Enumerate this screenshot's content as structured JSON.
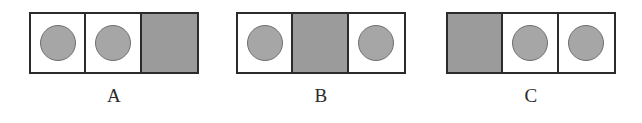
{
  "figure": {
    "colors": {
      "shaded_cell": "#9b9b9b",
      "disc": "#a6a6a6",
      "border": "#2b2b2b",
      "background": "#ffffff",
      "label_text": "#2a2a2a"
    },
    "groups": [
      {
        "label": "A",
        "left": 29,
        "width": 170,
        "cells": [
          {
            "fill": "white",
            "content": "circle"
          },
          {
            "fill": "white",
            "content": "circle"
          },
          {
            "fill": "shaded",
            "content": "none"
          }
        ]
      },
      {
        "label": "B",
        "left": 236,
        "width": 170,
        "cells": [
          {
            "fill": "white",
            "content": "circle"
          },
          {
            "fill": "shaded",
            "content": "none"
          },
          {
            "fill": "white",
            "content": "circle"
          }
        ]
      },
      {
        "label": "C",
        "left": 446,
        "width": 170,
        "cells": [
          {
            "fill": "shaded",
            "content": "none"
          },
          {
            "fill": "white",
            "content": "circle"
          },
          {
            "fill": "white",
            "content": "circle"
          }
        ]
      }
    ]
  }
}
